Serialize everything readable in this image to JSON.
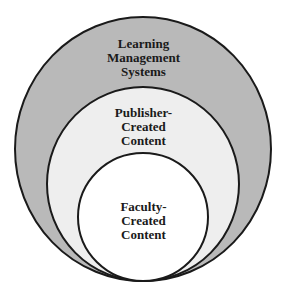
{
  "diagram": {
    "type": "nested-circles",
    "layers": [
      {
        "label_lines": [
          "Learning",
          "Management",
          "Systems"
        ],
        "fill": "#b8b8b8"
      },
      {
        "label_lines": [
          "Publisher-",
          "Created",
          "Content"
        ],
        "fill": "#eeeeee"
      },
      {
        "label_lines": [
          "Faculty-",
          "Created",
          "Content"
        ],
        "fill": "#ffffff"
      }
    ],
    "stroke": "#1a1a1a"
  }
}
